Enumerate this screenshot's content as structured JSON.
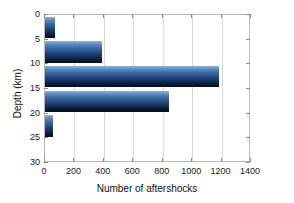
{
  "chart_data": {
    "type": "bar",
    "orientation": "horizontal",
    "title": "",
    "xlabel": "Number of aftershocks",
    "ylabel": "Depth (km)",
    "xlim": [
      0,
      1400
    ],
    "ylim": [
      0,
      30
    ],
    "xticks": [
      0,
      200,
      400,
      600,
      800,
      1000,
      1200,
      1400
    ],
    "yticks": [
      0,
      5,
      10,
      15,
      20,
      25,
      30
    ],
    "xticklabels": [
      "0",
      "200",
      "400",
      "600",
      "800",
      "1000",
      "1200",
      "1400"
    ],
    "yticklabels": [
      "0",
      "5",
      "10",
      "15",
      "20",
      "25",
      "30"
    ],
    "grid": "vertical",
    "legend": "none",
    "bin_width_km": 5,
    "categories": [
      "0-5",
      "5-10",
      "10-15",
      "15-20",
      "20-25"
    ],
    "bins": [
      {
        "depth_top": 0,
        "depth_bottom": 5,
        "value": 68
      },
      {
        "depth_top": 5,
        "depth_bottom": 10,
        "value": 385
      },
      {
        "depth_top": 10,
        "depth_bottom": 15,
        "value": 1180
      },
      {
        "depth_top": 15,
        "depth_bottom": 20,
        "value": 840
      },
      {
        "depth_top": 20,
        "depth_bottom": 25,
        "value": 55
      }
    ],
    "values": [
      68,
      385,
      1180,
      840,
      55
    ],
    "colors": {
      "bar_top": "#8fb4d9",
      "bar_mid": "#2d5490",
      "bar_bottom": "#050e1c",
      "gridline": "#d9d9d9",
      "axis": "#b8b8b8",
      "text": "#1a1a1a",
      "background": "#ffffff"
    }
  }
}
